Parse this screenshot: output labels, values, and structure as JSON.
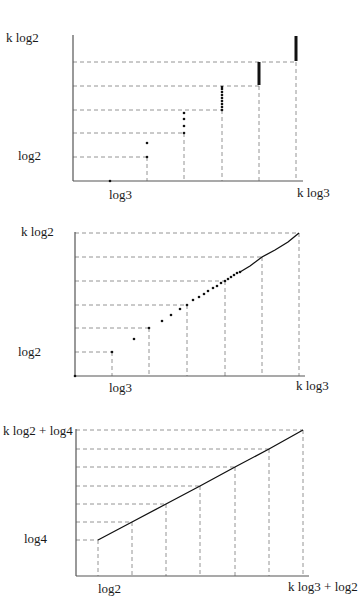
{
  "chart_data": [
    {
      "type": "scatter",
      "title": "",
      "description": "Discrete points: vertical clusters at multiples of log3 with heights stepping by log2",
      "xlabel": "",
      "ylabel": "",
      "x_tick_labels": {
        "first": "log3",
        "last": "k log3"
      },
      "y_tick_labels": {
        "first": "log2",
        "last": "k log2"
      },
      "grid": "dashed projections",
      "frame": {
        "x0": 73,
        "y0": 181,
        "x_end": 303,
        "y_top": 35
      },
      "x_ticks_px": [
        110,
        147,
        184,
        222,
        259,
        296
      ],
      "y_ticks_px": [
        157,
        133,
        110,
        86,
        62
      ],
      "h_grid": [
        {
          "y": 157,
          "x_to": 147
        },
        {
          "y": 133,
          "x_to": 184
        },
        {
          "y": 110,
          "x_to": 222
        },
        {
          "y": 86,
          "x_to": 259
        },
        {
          "y": 62,
          "x_to": 296
        }
      ],
      "v_grid": [
        {
          "x": 147,
          "y_from": 157
        },
        {
          "x": 184,
          "y_from": 133
        },
        {
          "x": 222,
          "y_from": 110
        },
        {
          "x": 259,
          "y_from": 86
        },
        {
          "x": 296,
          "y_from": 62
        }
      ],
      "points": [
        {
          "x": 110,
          "y": 181
        },
        {
          "x": 147,
          "y": 157
        },
        {
          "x": 147,
          "y": 143
        },
        {
          "x": 184,
          "y": 133
        },
        {
          "x": 184,
          "y": 126
        },
        {
          "x": 184,
          "y": 119
        },
        {
          "x": 184,
          "y": 113
        },
        {
          "x": 222,
          "y": 110
        },
        {
          "x": 222,
          "y": 107
        },
        {
          "x": 222,
          "y": 104
        },
        {
          "x": 222,
          "y": 101
        },
        {
          "x": 222,
          "y": 98
        },
        {
          "x": 222,
          "y": 95
        },
        {
          "x": 222,
          "y": 92
        },
        {
          "x": 222,
          "y": 89
        },
        {
          "x": 222,
          "y": 87
        }
      ],
      "bars": [
        {
          "x": 259,
          "y1": 85,
          "y2": 62
        },
        {
          "x": 296,
          "y1": 61,
          "y2": 36
        }
      ],
      "labels": [
        {
          "text": "k log2",
          "x": 6,
          "y": 42
        },
        {
          "text": "log2",
          "x": 18,
          "y": 160
        },
        {
          "text": "log3",
          "x": 109,
          "y": 199
        },
        {
          "text": "k log3",
          "x": 297,
          "y": 197
        }
      ]
    },
    {
      "type": "scatter",
      "title": "",
      "description": "Points become denser and merge into a curve approaching (k log3, k log2)",
      "xlabel": "",
      "ylabel": "",
      "x_tick_labels": {
        "first": "log3",
        "last": "k log3"
      },
      "y_tick_labels": {
        "first": "log2",
        "last": "k log2"
      },
      "grid": "dashed projections",
      "frame": {
        "x0": 75,
        "y0": 376,
        "x_end": 305,
        "y_top": 232
      },
      "h_grid": [
        {
          "y": 352,
          "x_to": 112
        },
        {
          "y": 328,
          "x_to": 149
        },
        {
          "y": 305,
          "x_to": 187
        },
        {
          "y": 281,
          "x_to": 225
        },
        {
          "y": 257,
          "x_to": 262
        },
        {
          "y": 233,
          "x_to": 299
        }
      ],
      "v_grid": [
        {
          "x": 112,
          "y_from": 352
        },
        {
          "x": 149,
          "y_from": 328
        },
        {
          "x": 187,
          "y_from": 305
        },
        {
          "x": 225,
          "y_from": 281
        },
        {
          "x": 262,
          "y_from": 257
        },
        {
          "x": 299,
          "y_from": 233
        }
      ],
      "points": [
        {
          "x": 75,
          "y": 376
        },
        {
          "x": 112,
          "y": 352
        },
        {
          "x": 134,
          "y": 339
        },
        {
          "x": 149,
          "y": 328
        },
        {
          "x": 162,
          "y": 321
        },
        {
          "x": 171,
          "y": 315
        },
        {
          "x": 180,
          "y": 309
        },
        {
          "x": 187,
          "y": 305
        },
        {
          "x": 193,
          "y": 300
        },
        {
          "x": 199,
          "y": 297
        },
        {
          "x": 204,
          "y": 294
        },
        {
          "x": 208,
          "y": 291
        },
        {
          "x": 213,
          "y": 288
        },
        {
          "x": 217,
          "y": 286
        },
        {
          "x": 221,
          "y": 283
        },
        {
          "x": 225,
          "y": 281
        },
        {
          "x": 228,
          "y": 279
        },
        {
          "x": 231,
          "y": 277
        },
        {
          "x": 234,
          "y": 275
        },
        {
          "x": 237,
          "y": 273
        },
        {
          "x": 240,
          "y": 272
        }
      ],
      "curve": [
        [
          240,
          272
        ],
        [
          250,
          266
        ],
        [
          262,
          257
        ],
        [
          275,
          250
        ],
        [
          288,
          242
        ],
        [
          299,
          233
        ]
      ],
      "labels": [
        {
          "text": "k log2",
          "x": 21,
          "y": 236
        },
        {
          "text": "log2",
          "x": 18,
          "y": 356
        },
        {
          "text": "log3",
          "x": 109,
          "y": 392
        },
        {
          "text": "k log3",
          "x": 296,
          "y": 390
        }
      ]
    },
    {
      "type": "line",
      "title": "",
      "description": "Piecewise-linear curve from (log2, log4) to (k log3 + log2, k log2 + log4)",
      "xlabel": "",
      "ylabel": "",
      "x_tick_labels": {
        "first": "log2",
        "last": "k log3 + log2"
      },
      "y_tick_labels": {
        "first": "log4",
        "last": "k log2 + log4"
      },
      "grid": "dashed projections",
      "frame": {
        "x0": 76,
        "y0": 576,
        "x_end": 309,
        "y_top": 429
      },
      "h_grid": [
        {
          "y": 540,
          "x_to": 98
        },
        {
          "y": 522,
          "x_to": 132
        },
        {
          "y": 504,
          "x_to": 166
        },
        {
          "y": 486,
          "x_to": 200
        },
        {
          "y": 467,
          "x_to": 235
        },
        {
          "y": 449,
          "x_to": 269
        },
        {
          "y": 430,
          "x_to": 303
        }
      ],
      "v_grid": [
        {
          "x": 98,
          "y_from": 540
        },
        {
          "x": 132,
          "y_from": 522
        },
        {
          "x": 166,
          "y_from": 504
        },
        {
          "x": 200,
          "y_from": 486
        },
        {
          "x": 235,
          "y_from": 467
        },
        {
          "x": 269,
          "y_from": 449
        },
        {
          "x": 303,
          "y_from": 430
        }
      ],
      "curve": [
        [
          98,
          540
        ],
        [
          132,
          522
        ],
        [
          166,
          504
        ],
        [
          200,
          486
        ],
        [
          235,
          467
        ],
        [
          269,
          449
        ],
        [
          303,
          430
        ]
      ],
      "labels": [
        {
          "text": "k log2 + log4",
          "x": 3,
          "y": 435
        },
        {
          "text": "log4",
          "x": 24,
          "y": 543
        },
        {
          "text": "log2",
          "x": 98,
          "y": 593
        },
        {
          "text": "k log3 + log2",
          "x": 288,
          "y": 591
        }
      ]
    }
  ]
}
